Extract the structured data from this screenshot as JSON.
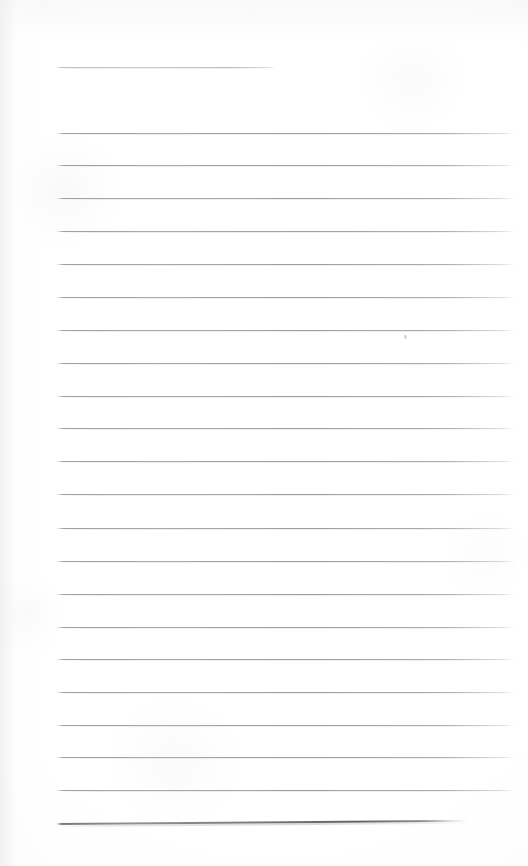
{
  "document": {
    "kind": "scanned-blank-ruled-page",
    "title": "",
    "body_text": "",
    "page_width": 528,
    "page_height": 866,
    "paper_color": "#fefefe",
    "rule_color": "#9aa0a7",
    "heavy_rule_color": "#6d7179",
    "rule_count": 23,
    "content_left": 57,
    "content_right": 514
  },
  "rules": [
    {
      "id": "rule-1",
      "y": 67,
      "x": 57,
      "width": 218,
      "weight": "faint",
      "slant": 0.0,
      "note": "short top rule"
    },
    {
      "id": "rule-2",
      "y": 133,
      "x": 57,
      "width": 457,
      "weight": "normal",
      "slant": 0.0,
      "note": ""
    },
    {
      "id": "rule-3",
      "y": 165,
      "x": 57,
      "width": 457,
      "weight": "normal",
      "slant": 0.0,
      "note": ""
    },
    {
      "id": "rule-4",
      "y": 198,
      "x": 57,
      "width": 457,
      "weight": "normal",
      "slant": 0.0,
      "note": ""
    },
    {
      "id": "rule-5",
      "y": 231,
      "x": 57,
      "width": 457,
      "weight": "normal",
      "slant": 0.0,
      "note": ""
    },
    {
      "id": "rule-6",
      "y": 264,
      "x": 57,
      "width": 457,
      "weight": "normal",
      "slant": 0.0,
      "note": ""
    },
    {
      "id": "rule-7",
      "y": 297,
      "x": 57,
      "width": 457,
      "weight": "normal",
      "slant": 0.0,
      "note": ""
    },
    {
      "id": "rule-8",
      "y": 330,
      "x": 57,
      "width": 457,
      "weight": "normal",
      "slant": 0.0,
      "note": ""
    },
    {
      "id": "rule-9",
      "y": 363,
      "x": 57,
      "width": 457,
      "weight": "normal",
      "slant": 0.0,
      "note": ""
    },
    {
      "id": "rule-10",
      "y": 396,
      "x": 57,
      "width": 457,
      "weight": "normal",
      "slant": 0.0,
      "note": ""
    },
    {
      "id": "rule-11",
      "y": 428,
      "x": 57,
      "width": 457,
      "weight": "normal",
      "slant": 0.0,
      "note": ""
    },
    {
      "id": "rule-12",
      "y": 461,
      "x": 57,
      "width": 457,
      "weight": "normal",
      "slant": 0.0,
      "note": ""
    },
    {
      "id": "rule-13",
      "y": 494,
      "x": 57,
      "width": 457,
      "weight": "normal",
      "slant": 0.0,
      "note": ""
    },
    {
      "id": "rule-14",
      "y": 528,
      "x": 57,
      "width": 457,
      "weight": "normal",
      "slant": 0.0,
      "note": ""
    },
    {
      "id": "rule-15",
      "y": 561,
      "x": 57,
      "width": 457,
      "weight": "normal",
      "slant": 0.0,
      "note": ""
    },
    {
      "id": "rule-16",
      "y": 594,
      "x": 57,
      "width": 457,
      "weight": "normal",
      "slant": 0.0,
      "note": ""
    },
    {
      "id": "rule-17",
      "y": 627,
      "x": 57,
      "width": 457,
      "weight": "normal",
      "slant": 0.0,
      "note": ""
    },
    {
      "id": "rule-18",
      "y": 659,
      "x": 57,
      "width": 457,
      "weight": "normal",
      "slant": 0.0,
      "note": ""
    },
    {
      "id": "rule-19",
      "y": 692,
      "x": 57,
      "width": 457,
      "weight": "normal",
      "slant": 0.0,
      "note": ""
    },
    {
      "id": "rule-20",
      "y": 725,
      "x": 57,
      "width": 457,
      "weight": "normal",
      "slant": 0.0,
      "note": ""
    },
    {
      "id": "rule-21",
      "y": 757,
      "x": 57,
      "width": 457,
      "weight": "normal",
      "slant": 0.0,
      "note": ""
    },
    {
      "id": "rule-22",
      "y": 790,
      "x": 57,
      "width": 457,
      "weight": "normal",
      "slant": 0.0,
      "note": ""
    },
    {
      "id": "rule-23",
      "y": 823,
      "x": 57,
      "width": 412,
      "weight": "heavy",
      "slant": -0.45,
      "note": "darker slanted bottom rule"
    }
  ],
  "marks": [
    {
      "id": "speck-1",
      "x": 404,
      "y": 335,
      "note": "faint scanner speck below rule-8"
    }
  ]
}
